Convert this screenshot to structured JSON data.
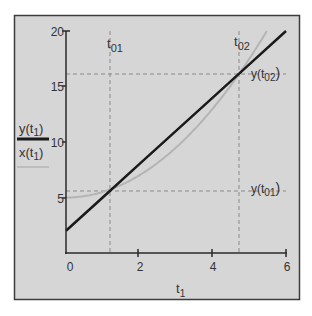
{
  "chart_data": {
    "type": "line",
    "title": "",
    "xlabel": "t1",
    "ylabel": "",
    "xlim": [
      0,
      6
    ],
    "ylim": [
      0,
      20
    ],
    "x_ticks": [
      0,
      2,
      4,
      6
    ],
    "y_ticks": [
      5,
      10,
      15,
      20
    ],
    "grid": false,
    "legend_position": "left",
    "series": [
      {
        "name": "y(t1)",
        "style": "solid thick black",
        "color": "#1a1a1a",
        "formula": "y = 3*t + 2",
        "x": [
          0,
          1,
          2,
          3,
          4,
          5,
          6
        ],
        "values": [
          2,
          5,
          8,
          11,
          14,
          17,
          20
        ]
      },
      {
        "name": "x(t1)",
        "style": "solid thin gray",
        "color": "#b4b4b4",
        "formula": "x = 5 + 0.5*t^2",
        "x": [
          0,
          1,
          2,
          3,
          4,
          5,
          5.48
        ],
        "values": [
          5,
          5.5,
          7,
          9.5,
          13,
          17.5,
          20
        ]
      }
    ],
    "annotations": [
      {
        "label": "t01",
        "type": "vertical-dashed",
        "x": 1.2
      },
      {
        "label": "t02",
        "type": "vertical-dashed",
        "x": 4.7
      },
      {
        "label": "y(t01)",
        "type": "horizontal-dashed",
        "y": 5.6
      },
      {
        "label": "y(t02)",
        "type": "horizontal-dashed",
        "y": 16.1
      }
    ]
  },
  "labels": {
    "y_ticks": [
      "5",
      "10",
      "15",
      "20"
    ],
    "x_ticks": [
      "0",
      "2",
      "4",
      "6"
    ],
    "xlabel_base": "t",
    "xlabel_sub": "1",
    "t01_base": "t",
    "t01_sub": "01",
    "t02_base": "t",
    "t02_sub": "02",
    "yt01_pre": "y(t",
    "yt01_sub": "01",
    "yt01_post": ")",
    "yt02_pre": "y(t",
    "yt02_sub": "02",
    "yt02_post": ")",
    "legend_y_pre": "y(t",
    "legend_y_sub": "1",
    "legend_y_post": ")",
    "legend_x_pre": "x(t",
    "legend_x_sub": "1",
    "legend_x_post": ")"
  },
  "colors": {
    "panel_bg": "#d6d6d6",
    "frame": "#3c3c3c",
    "line_y": "#1a1a1a",
    "line_x": "#b4b4b4",
    "dash": "#8a8a8a"
  }
}
